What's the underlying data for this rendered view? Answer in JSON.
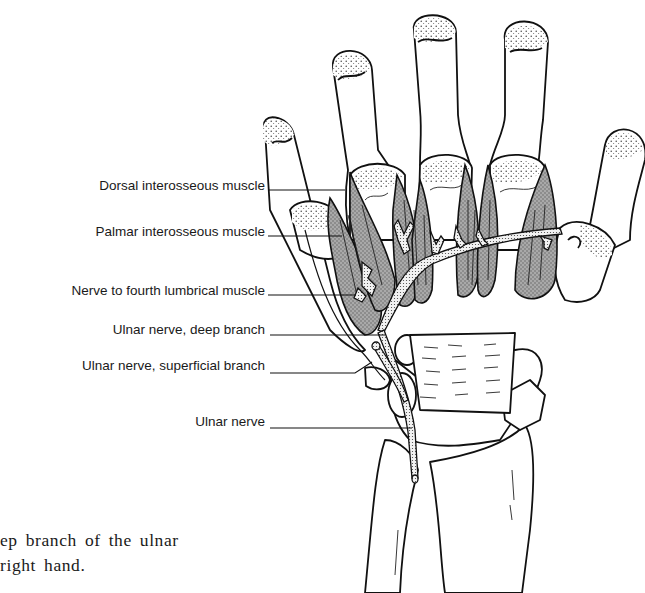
{
  "figure": {
    "labels": [
      {
        "id": "dorsal-interosseous",
        "text": "Dorsal interosseous muscle",
        "top": 178
      },
      {
        "id": "palmar-interosseous",
        "text": "Palmar interosseous muscle",
        "top": 224
      },
      {
        "id": "nerve-fourth-lumbrical",
        "text": "Nerve to fourth lumbrical muscle",
        "top": 283
      },
      {
        "id": "ulnar-deep-branch",
        "text": "Ulnar nerve, deep branch",
        "top": 322
      },
      {
        "id": "ulnar-superficial-branch",
        "text": "Ulnar nerve, superficial branch",
        "top": 358
      },
      {
        "id": "ulnar-nerve",
        "text": "Ulnar nerve",
        "top": 414
      }
    ]
  },
  "caption": {
    "line1": "ep branch of the ulnar",
    "line2": "right hand."
  }
}
